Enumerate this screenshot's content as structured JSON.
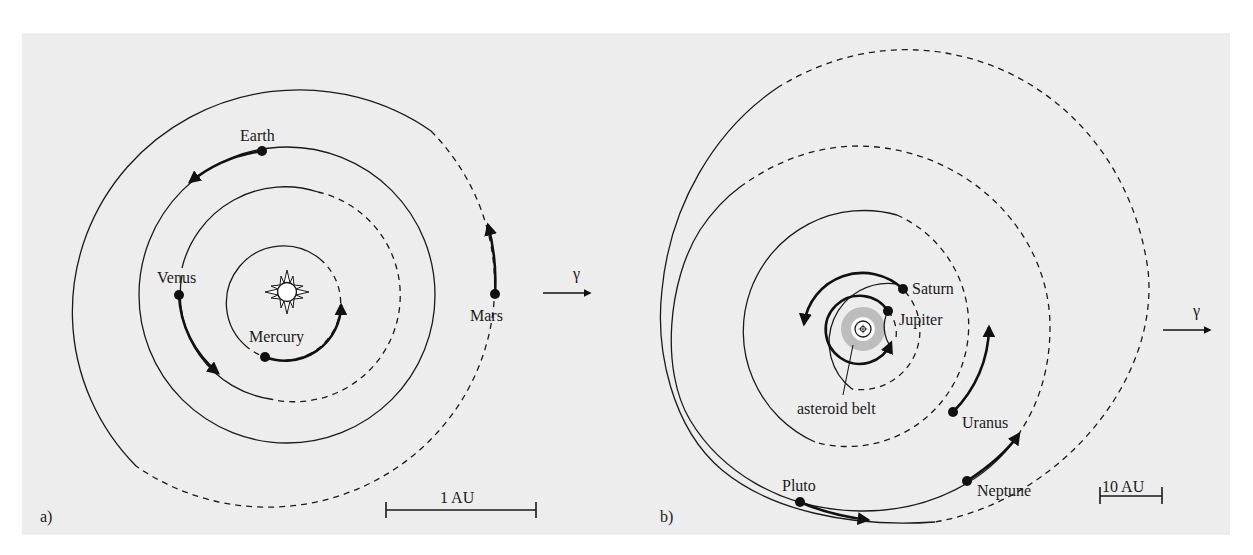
{
  "figure": {
    "type": "orbital-diagram",
    "background_color": "#ededed",
    "line_color": "#1a1a1a",
    "belt_color": "#bdbdbd"
  },
  "panel_a": {
    "label": "a)",
    "title": "Inner planets",
    "sun_symbol": "sun-icon",
    "planets": [
      {
        "name": "Mercury",
        "label": "Mercury"
      },
      {
        "name": "Venus",
        "label": "Venus"
      },
      {
        "name": "Earth",
        "label": "Earth"
      },
      {
        "name": "Mars",
        "label": "Mars"
      }
    ],
    "vernal_equinox_symbol": "γ",
    "scale_bar_label": "1 AU"
  },
  "panel_b": {
    "label": "b)",
    "title": "Outer planets",
    "planets": [
      {
        "name": "Jupiter",
        "label": "Jupiter"
      },
      {
        "name": "Saturn",
        "label": "Saturn"
      },
      {
        "name": "Uranus",
        "label": "Uranus"
      },
      {
        "name": "Neptune",
        "label": "Neptune"
      },
      {
        "name": "Pluto",
        "label": "Pluto"
      }
    ],
    "asteroid_belt_label": "asteroid belt",
    "vernal_equinox_symbol": "γ",
    "scale_bar_label": "10 AU"
  }
}
